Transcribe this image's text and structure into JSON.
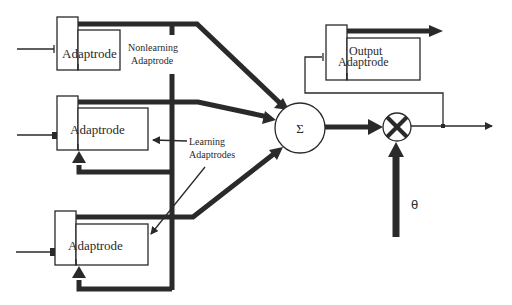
{
  "diagram": {
    "type": "adaptrode-neuron-block-diagram",
    "adaptrodes": [
      {
        "id": "top",
        "label": "Adaptrode",
        "role": "nonlearning"
      },
      {
        "id": "middle",
        "label": "Adaptrode",
        "role": "learning"
      },
      {
        "id": "bottom",
        "label": "Adaptrode",
        "role": "learning"
      },
      {
        "id": "output",
        "label_line1": "Output",
        "label_line2": "Adaptrode",
        "role": "output"
      }
    ],
    "labels": {
      "nonlearning_line1": "Nonlearning",
      "nonlearning_line2": "Adaptrode",
      "learning_line1": "Learning",
      "learning_line2": "Adaptrodes",
      "summation_symbol": "Σ",
      "multiply_symbol": "⊗",
      "threshold_symbol": "θ"
    },
    "colors": {
      "ink": "#2a2a2a",
      "background": "#ffffff"
    }
  }
}
